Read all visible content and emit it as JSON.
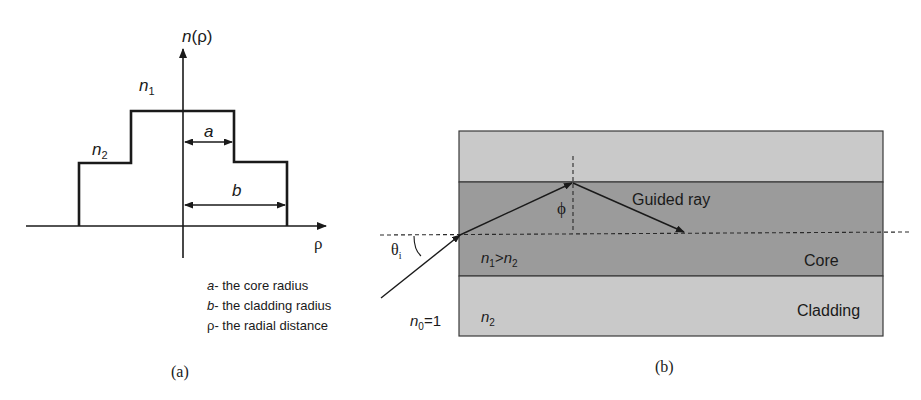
{
  "panel_a": {
    "caption": "(a)",
    "y_axis_label_n": "n",
    "y_axis_label_rho": "(ρ)",
    "x_axis_label": "ρ",
    "n1_label": "n",
    "n1_sub": "1",
    "n2_label": "n",
    "n2_sub": "2",
    "a_label": "a",
    "b_label": "b",
    "legend": [
      {
        "symbol": "a",
        "text": "- the core radius"
      },
      {
        "symbol": "b",
        "text": "- the cladding radius"
      },
      {
        "symbol": "ρ",
        "text": "- the radial distance"
      }
    ]
  },
  "panel_b": {
    "caption": "(b)",
    "guided_ray_label": "Guided ray",
    "phi_label": "ϕ",
    "theta_label": "θ",
    "theta_sub": "i",
    "core_index_label": {
      "n1": "n",
      "n1_sub": "1",
      "op": ">",
      "n2": "n",
      "n2_sub": "2"
    },
    "core_label": "Core",
    "cladding_label": "Cladding",
    "cladding_index_label": {
      "n": "n",
      "sub": "2"
    },
    "outside_index_label": {
      "n": "n",
      "sub": "0",
      "value": "=1"
    },
    "colors": {
      "cladding": "#c9c9c9",
      "core": "#9b9b9b",
      "line": "#1a1a1a"
    }
  }
}
